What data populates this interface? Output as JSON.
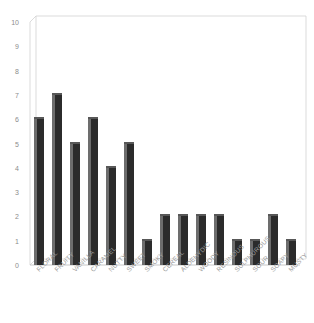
{
  "chart_data": {
    "type": "bar",
    "title": "",
    "subtitle": "",
    "xlabel": "",
    "ylabel": "",
    "ylim": [
      0,
      10
    ],
    "yticks": [
      0,
      1,
      2,
      3,
      4,
      5,
      6,
      7,
      8,
      9,
      10
    ],
    "grid": false,
    "legend": null,
    "categories": [
      "FLORAL",
      "FRUITY",
      "VANILLA",
      "CARAMEL",
      "NUTTY",
      "SWEET",
      "SMOKY",
      "CEREAL",
      "ALDEHYDIC",
      "WOODY",
      "RESINOUS",
      "SULPHUROUS",
      "SOUR",
      "SOAPY",
      "MUSTY"
    ],
    "values": [
      6,
      7,
      5,
      6,
      4,
      5,
      1,
      2,
      2,
      2,
      2,
      1,
      1,
      2,
      1
    ],
    "style": {
      "bar_face_color": "#2b2b2b",
      "bar_side_color": "#6d6d6d",
      "bar_top_color": "#585858",
      "axis_color": "#c8c8c8",
      "tick_label_color": "#8c8c8c",
      "category_label_color": "#9a9a9a",
      "background_color": "#ffffff",
      "projection": "3d",
      "category_label_rotation_deg": -45
    }
  }
}
